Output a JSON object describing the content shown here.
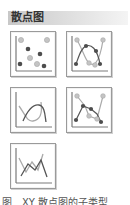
{
  "header": {
    "title": "散点图"
  },
  "chart_types": [
    {
      "name": "scatter-markers-only",
      "icon": "scatter-icon"
    },
    {
      "name": "scatter-smooth-lines-markers",
      "icon": "scatter-smooth-markers-icon"
    },
    {
      "name": "scatter-smooth-lines",
      "icon": "scatter-smooth-lines-icon"
    },
    {
      "name": "scatter-straight-lines-markers",
      "icon": "scatter-straight-markers-icon"
    },
    {
      "name": "scatter-straight-lines",
      "icon": "scatter-straight-lines-icon"
    }
  ],
  "colors": {
    "axis": "#7a7a7a",
    "marker_dark": "#555555",
    "marker_light": "#b8b8b8",
    "line_dark": "#666666",
    "line_light": "#aaaaaa",
    "border": "#9a9a9a"
  },
  "caption": "图　XY 散点图的子类型"
}
